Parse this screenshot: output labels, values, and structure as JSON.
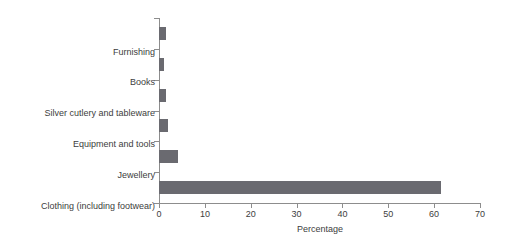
{
  "chart_data": {
    "type": "bar",
    "orientation": "horizontal",
    "title": "",
    "subtitle": "",
    "xlabel": "Percentage",
    "ylabel": "",
    "categories": [
      "Furnishing",
      "Books",
      "Silver cutlery and tableware",
      "Equipment and tools",
      "Jewellery",
      "Clothing (including footwear)"
    ],
    "values": [
      1.5,
      1.0,
      1.5,
      2.0,
      4.2,
      61.5
    ],
    "series": [
      {
        "name": "Percentage",
        "values": [
          1.5,
          1.0,
          1.5,
          2.0,
          4.2,
          61.5
        ]
      }
    ],
    "xlim": [
      0,
      70
    ],
    "xticks": [
      0,
      10,
      20,
      30,
      40,
      50,
      60,
      70
    ],
    "xtick_labels": [
      "0",
      "10",
      "20",
      "30",
      "40",
      "50",
      "60",
      "70"
    ],
    "grid": false,
    "legend": false,
    "legend_position": "none",
    "bar_color": "#6a6a70",
    "axis_color": "#8d8d8d",
    "background_color": "#ffffff",
    "text_color": "#3d3d3d"
  }
}
